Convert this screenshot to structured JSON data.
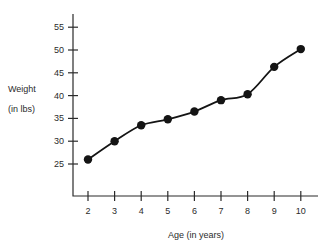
{
  "chart_data": {
    "type": "line",
    "title": "",
    "xlabel": "Age (in years)",
    "ylabel": "Weight",
    "ylabel_line2": "(in lbs)",
    "x": [
      2,
      3,
      4,
      5,
      6,
      7,
      8,
      9,
      10
    ],
    "values": [
      26,
      30,
      33.5,
      34.8,
      36.5,
      39,
      40.3,
      46.3,
      50.2
    ],
    "xticks": [
      "2",
      "3",
      "4",
      "5",
      "6",
      "7",
      "8",
      "9",
      "10"
    ],
    "yticks": [
      "25",
      "30",
      "35",
      "40",
      "45",
      "50",
      "55"
    ],
    "xlim": [
      1.5,
      10.5
    ],
    "ylim": [
      21,
      57
    ],
    "grid": false,
    "legend": false,
    "marker": "filled-circle",
    "line_color": "#141414",
    "marker_color": "#141414",
    "axis_color": "#2b2b2b",
    "background": "#ffffff"
  }
}
